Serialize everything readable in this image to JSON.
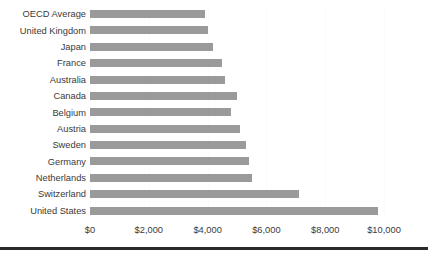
{
  "chart_data": {
    "type": "bar",
    "orientation": "horizontal",
    "title": "",
    "subtitle": "",
    "xlabel": "",
    "ylabel": "",
    "categories": [
      "OECD Average",
      "United Kingdom",
      "Japan",
      "France",
      "Australia",
      "Canada",
      "Belgium",
      "Austria",
      "Sweden",
      "Germany",
      "Netherlands",
      "Switzerland",
      "United States"
    ],
    "values": [
      3900,
      4000,
      4200,
      4500,
      4600,
      5000,
      4800,
      5100,
      5300,
      5400,
      5500,
      7100,
      9800
    ],
    "xlim": [
      0,
      10000
    ],
    "xticks": [
      0,
      2000,
      4000,
      6000,
      8000,
      10000
    ],
    "xticklabels": [
      "$0",
      "$2,000",
      "$4,000",
      "$6,000",
      "$8,000",
      "$10,000"
    ],
    "grid": true,
    "grid_axis": "x",
    "legend": false,
    "legend_position": "none",
    "bar_color": "#9a9a9a",
    "gridline_color": "#fbfbfb",
    "text_color": "#3a3a3a",
    "background_color": "#ffffff",
    "annotations": []
  }
}
